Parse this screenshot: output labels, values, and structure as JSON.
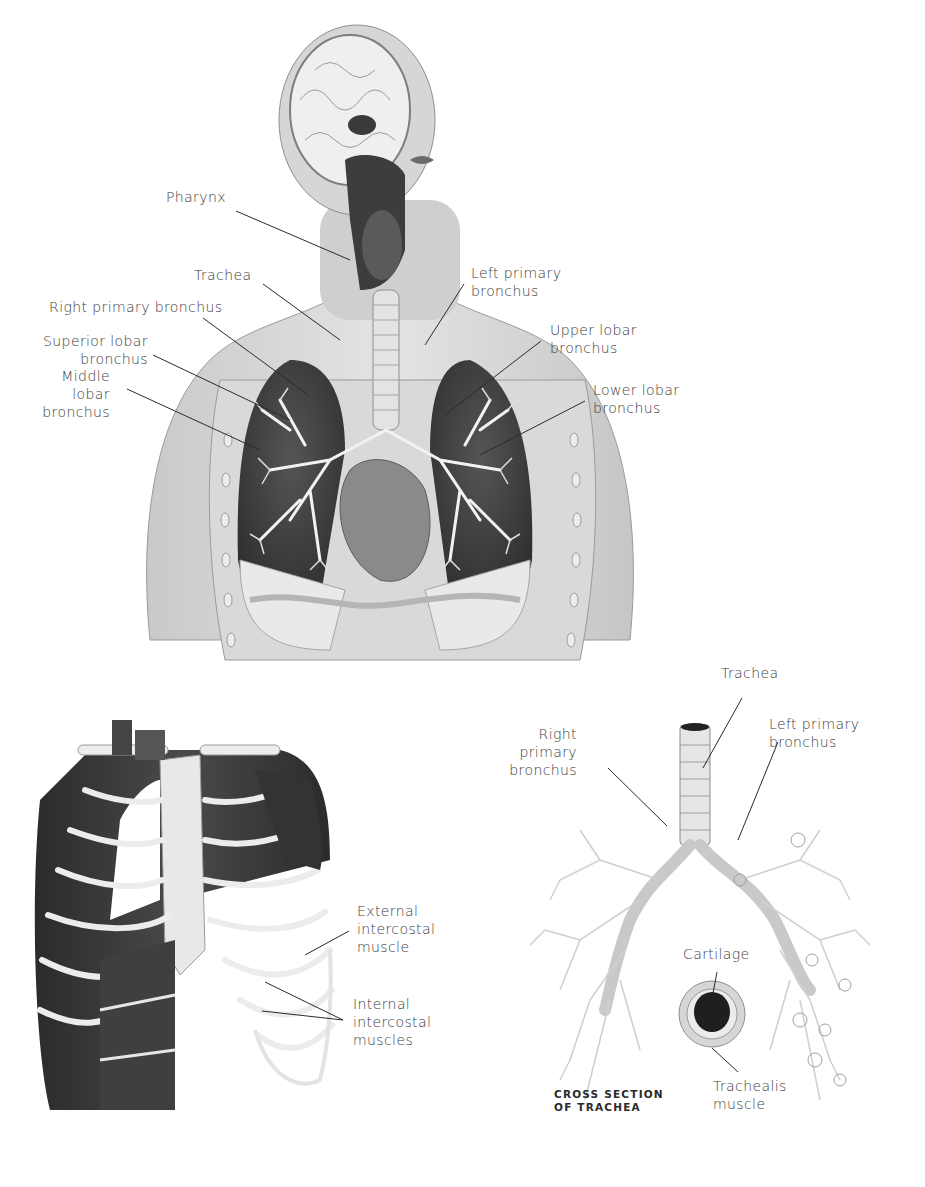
{
  "figure": {
    "main_illustration": {
      "subject": "respiratory-system-torso-head",
      "labels": [
        {
          "id": "pharynx",
          "text": "Pharynx"
        },
        {
          "id": "trachea",
          "text": "Trachea"
        },
        {
          "id": "right_primary_bronchus",
          "text": "Right primary bronchus"
        },
        {
          "id": "superior_lobar_bronchus",
          "text": "Superior lobar\nbronchus"
        },
        {
          "id": "middle_lobar_bronchus",
          "text": "Middle\nlobar\nbronchus"
        },
        {
          "id": "left_primary_bronchus",
          "text": "Left primary\nbronchus"
        },
        {
          "id": "upper_lobar_bronchus",
          "text": "Upper lobar\nbronchus"
        },
        {
          "id": "lower_lobar_bronchus",
          "text": "Lower lobar\nbronchus"
        }
      ]
    },
    "ribcage_illustration": {
      "subject": "ribcage-intercostal-muscles",
      "labels": [
        {
          "id": "external_intercostal",
          "text": "External\nintercostal\nmuscle"
        },
        {
          "id": "internal_intercostal",
          "text": "Internal\nintercostal\nmuscles"
        }
      ]
    },
    "bronchial_tree_illustration": {
      "subject": "bronchial-tree",
      "labels": [
        {
          "id": "trachea",
          "text": "Trachea"
        },
        {
          "id": "right_primary_bronchus",
          "text": "Right\nprimary\nbronchus"
        },
        {
          "id": "left_primary_bronchus",
          "text": "Left primary\nbronchus"
        },
        {
          "id": "cartilage",
          "text": "Cartilage"
        },
        {
          "id": "trachealis_muscle",
          "text": "Trachealis\nmuscle"
        }
      ],
      "inset_caption": "CROSS SECTION\nOF TRACHEA"
    }
  },
  "colors": {
    "background": "#ffffff",
    "label_text": "#3c3c3c",
    "leader_line": "#2b2b2b",
    "skin_tone": "#d4d4d4",
    "lung_dark": "#3a3a3a",
    "muscle_dark": "#2f2f2f",
    "bone_light": "#e6e6e6"
  }
}
